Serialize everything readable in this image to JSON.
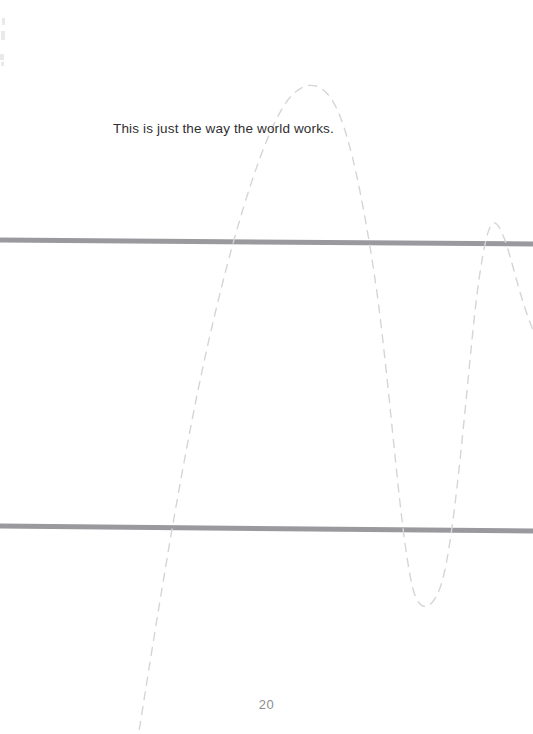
{
  "page": {
    "width": 533,
    "height": 734,
    "background_color": "#ffffff",
    "page_number": "20"
  },
  "content": {
    "body_text": "This is just the way the world works.",
    "body_text_color": "#2f2f31"
  },
  "rules": [
    {
      "name": "upper-horizontal-rule",
      "color": "#9a9a9e",
      "thickness": 5,
      "x1": 0,
      "y1": 240,
      "x2": 533,
      "y2": 244
    },
    {
      "name": "lower-horizontal-rule",
      "color": "#9a9a9e",
      "thickness": 5,
      "x1": 0,
      "y1": 526,
      "x2": 533,
      "y2": 531
    }
  ],
  "curve": {
    "name": "dashed-sine-curve",
    "style": "dashed",
    "color": "#d5d5d8",
    "stroke_width": 1.4,
    "dash_length": 8,
    "dash_gap": 7,
    "description": "Hand-drawn dashed sinusoid with decreasing period toward the right edge",
    "key_points": {
      "bottom_left_exit": [
        137,
        734
      ],
      "first_peak": [
        310,
        83
      ],
      "first_trough": [
        418,
        606
      ],
      "second_peak": [
        493,
        222
      ],
      "right_edge_exit": [
        533,
        300
      ]
    },
    "path": "M 137 744 C 152 650 172 520 196 400 C 220 282 255 150 285 104 C 300 82 318 78 332 100 C 348 124 364 200 378 300 C 392 410 400 530 412 585 C 418 612 430 614 440 588 C 452 556 462 440 472 340 C 478 278 486 226 493 223 C 500 220 508 248 516 278 C 522 300 528 318 533 330"
  },
  "artifacts": {
    "description": "faint scanner specks along the left edge",
    "specks": [
      {
        "x": 2,
        "y": 18,
        "w": 3,
        "h": 7
      },
      {
        "x": 1,
        "y": 31,
        "w": 4,
        "h": 9
      },
      {
        "x": 0,
        "y": 54,
        "w": 4,
        "h": 6
      },
      {
        "x": 1,
        "y": 62,
        "w": 3,
        "h": 4
      }
    ]
  }
}
